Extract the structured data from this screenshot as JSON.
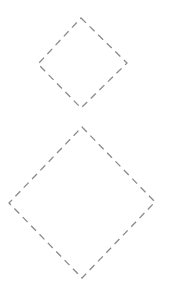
{
  "canvas": {
    "width": 170,
    "height": 294,
    "background": "#ffffff"
  },
  "style": {
    "stroke": "#8a8a8a",
    "stroke_width": 1.3,
    "dasharray": "7,5"
  },
  "shapes": [
    {
      "name": "diamond-small",
      "type": "diamond",
      "points": [
        [
          81,
          18
        ],
        [
          127,
          63
        ],
        [
          81,
          108
        ],
        [
          38,
          64
        ]
      ]
    },
    {
      "name": "diamond-large",
      "type": "diamond",
      "points": [
        [
          82,
          127
        ],
        [
          155,
          202
        ],
        [
          82,
          278
        ],
        [
          9,
          203
        ]
      ]
    }
  ]
}
